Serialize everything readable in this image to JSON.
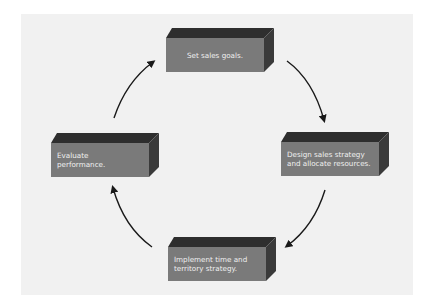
{
  "diagram": {
    "type": "cycle",
    "steps": [
      {
        "id": "set-goals",
        "label": "Set sales goals."
      },
      {
        "id": "design-strategy",
        "label": "Design sales strategy and allocate resources.",
        "lines": [
          "Design sales strategy",
          "and allocate resources."
        ]
      },
      {
        "id": "implement",
        "label": "Implement time and territory strategy.",
        "lines": [
          "Implement time and",
          "territory strategy."
        ]
      },
      {
        "id": "evaluate",
        "label": "Evaluate performance.",
        "lines": [
          "Evaluate",
          "performance."
        ]
      }
    ],
    "flow": [
      {
        "from": "set-goals",
        "to": "design-strategy"
      },
      {
        "from": "design-strategy",
        "to": "implement"
      },
      {
        "from": "implement",
        "to": "evaluate"
      },
      {
        "from": "evaluate",
        "to": "set-goals"
      }
    ],
    "colors": {
      "panel_bg": "#f1f1f1",
      "box_front": "#7a7a7a",
      "box_top": "#2e2e2e",
      "box_side": "#3a3a3a",
      "box_text": "#f0f0f0",
      "arrow": "#1a1a1a"
    }
  }
}
